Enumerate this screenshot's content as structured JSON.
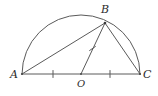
{
  "figure": {
    "kind": "geometry-diagram",
    "background_color": "#ffffff",
    "stroke_color": "#4a4a4a",
    "label_color": "#2b2b2b",
    "labels": {
      "a": "A",
      "b": "B",
      "c": "C",
      "o": "O"
    }
  },
  "chart_data": {
    "type": "scatter",
    "title": "",
    "xlabel": "",
    "ylabel": "",
    "points": [
      {
        "name": "A",
        "x": 22,
        "y": 74,
        "label": "A",
        "label_x": 10,
        "label_y": 69
      },
      {
        "name": "B",
        "x": 105,
        "y": 23,
        "label": "B",
        "label_x": 101,
        "label_y": 4
      },
      {
        "name": "C",
        "x": 140,
        "y": 74,
        "label": "C",
        "label_x": 143,
        "label_y": 69
      },
      {
        "name": "O",
        "x": 81,
        "y": 74,
        "label": "O",
        "label_x": 77,
        "label_y": 78
      }
    ],
    "segments": [
      {
        "name": "AC",
        "from": "A",
        "to": "C"
      },
      {
        "name": "AB",
        "from": "A",
        "to": "B"
      },
      {
        "name": "OB",
        "from": "O",
        "to": "B"
      },
      {
        "name": "BC",
        "from": "B",
        "to": "C"
      }
    ],
    "arc": {
      "name": "semicircle-arc-AC",
      "center_x": 81,
      "center_y": 74,
      "radius": 59,
      "start_angle_deg": 180,
      "end_angle_deg": 0
    },
    "tick_marks": [
      {
        "name": "tick-AO",
        "x": 53,
        "y": 74,
        "angle_deg": 90,
        "segment": "AO"
      },
      {
        "name": "tick-OC",
        "x": 110,
        "y": 74,
        "angle_deg": 90,
        "segment": "OC"
      },
      {
        "name": "tick-OB",
        "x": 92.5,
        "y": 48.5,
        "angle_deg": 146,
        "segment": "OB"
      }
    ],
    "annotations": [
      "Tick marks on AO, OC and OB indicate these three segments are equal (radii)."
    ]
  }
}
